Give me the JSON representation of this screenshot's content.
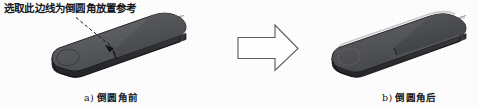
{
  "figure": {
    "background_color": "#fdfdfd",
    "annotation": {
      "text": "选取此边线为倒圆角放置参考",
      "leader_style": "dashed-with-arrowhead",
      "color": "#16171a"
    },
    "captions": [
      {
        "index": "a)",
        "label": "倒圆角前"
      },
      {
        "index": "b)",
        "label": "倒圆角后"
      }
    ],
    "transition_arrow": {
      "icon": "right-arrow-outline",
      "direction": "right",
      "fill": "#ffffff",
      "stroke": "#5a5a5a"
    },
    "objects": [
      {
        "name": "part-before-fillet",
        "description": "isometric dark-gray rounded-rectangular slab with sharp edges",
        "top_face_color": "#5b5c60",
        "top_face_color_right": "#4e4f53",
        "front_face_color": "#2d2e31",
        "side_face_color": "#37383c",
        "outline_color": "#1d1e21",
        "wire_color": "#8e8f92"
      },
      {
        "name": "part-after-fillet",
        "description": "same slab with filleted / rounded edges",
        "top_face_color": "#55565a",
        "top_face_color_right": "#48494d",
        "front_face_color": "#303134",
        "side_face_color": "#3b3c40",
        "outline_color": "#1d1e21",
        "wire_color": "#8e8f92"
      }
    ]
  }
}
